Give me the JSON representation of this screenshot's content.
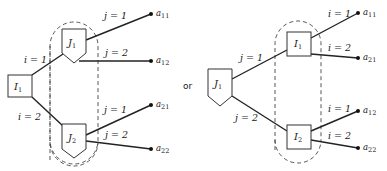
{
  "separator": "or",
  "left_tree": {
    "root": {
      "letter": "I",
      "sub": "1",
      "shape": "square"
    },
    "root_branches": [
      {
        "var": "i",
        "value": "1",
        "label": "i = 1"
      },
      {
        "var": "i",
        "value": "2",
        "label": "i = 2"
      }
    ],
    "information_set": {
      "style": "dashed",
      "nodes": [
        {
          "letter": "J",
          "sub": "1",
          "shape": "pentagon"
        },
        {
          "letter": "J",
          "sub": "2",
          "shape": "pentagon"
        }
      ]
    },
    "leaf_branches": [
      {
        "from": "J1",
        "label": "j = 1",
        "payoff": "a",
        "payoff_sub": "11"
      },
      {
        "from": "J1",
        "label": "j = 2",
        "payoff": "a",
        "payoff_sub": "12"
      },
      {
        "from": "J2",
        "label": "j = 1",
        "payoff": "a",
        "payoff_sub": "21"
      },
      {
        "from": "J2",
        "label": "j = 2",
        "payoff": "a",
        "payoff_sub": "22"
      }
    ]
  },
  "right_tree": {
    "root": {
      "letter": "J",
      "sub": "1",
      "shape": "pentagon"
    },
    "root_branches": [
      {
        "var": "j",
        "value": "1",
        "label": "j = 1"
      },
      {
        "var": "j",
        "value": "2",
        "label": "j = 2"
      }
    ],
    "information_set": {
      "style": "dashed",
      "nodes": [
        {
          "letter": "I",
          "sub": "1",
          "shape": "square"
        },
        {
          "letter": "I",
          "sub": "2",
          "shape": "square"
        }
      ]
    },
    "leaf_branches": [
      {
        "from": "I1",
        "label": "i = 1",
        "payoff": "a",
        "payoff_sub": "11"
      },
      {
        "from": "I1",
        "label": "i = 2",
        "payoff": "a",
        "payoff_sub": "21"
      },
      {
        "from": "I2",
        "label": "i = 1",
        "payoff": "a",
        "payoff_sub": "12"
      },
      {
        "from": "I2",
        "label": "i = 2",
        "payoff": "a",
        "payoff_sub": "22"
      }
    ]
  }
}
